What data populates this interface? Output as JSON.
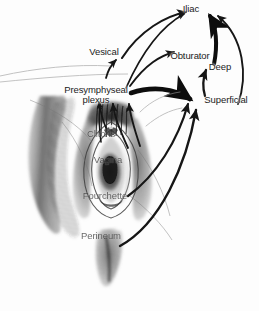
{
  "figure": {
    "kind": "anatomical-lymphatic-drainage-diagram",
    "background_color": "#fdfdfd",
    "ink_color": "#1b1b1b",
    "shading_color": "#4a4a4a"
  },
  "labels": {
    "iliac": "Iliac",
    "vesical": "Vesical",
    "obturator": "Obturator",
    "deep": "Deep",
    "superficial": "Superficial",
    "presymphyseal_line1": "Presymphyseal",
    "presymphyseal_line2": "plexus",
    "clitoris": "Clitoris",
    "vagina": "Vagina",
    "fourchette": "Fourchette",
    "perineum": "Perineum"
  },
  "flows": [
    {
      "from": "Vesical",
      "to": "Iliac"
    },
    {
      "from": "Presymphyseal plexus",
      "to": "Iliac"
    },
    {
      "from": "Presymphyseal plexus",
      "to": "Obturator"
    },
    {
      "from": "Presymphyseal plexus",
      "to": "Superficial"
    },
    {
      "from": "Superficial",
      "to": "Deep"
    },
    {
      "from": "Deep",
      "to": "Iliac"
    },
    {
      "from": "Clitoris",
      "to": "Presymphyseal plexus"
    },
    {
      "from": "Vagina",
      "to": "Presymphyseal plexus"
    },
    {
      "from": "Fourchette",
      "to": "Superficial"
    },
    {
      "from": "Perineum",
      "to": "Superficial"
    }
  ]
}
